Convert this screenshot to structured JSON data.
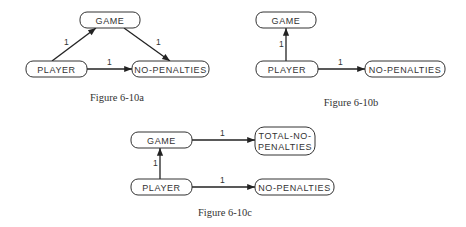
{
  "figures": [
    {
      "id": "a",
      "caption": "Figure 6-10a",
      "nodes": {
        "game": "GAME",
        "player": "PLAYER",
        "no_penalties": "NO-PENALTIES"
      },
      "edges": [
        {
          "from": "PLAYER",
          "to": "GAME",
          "label": "1"
        },
        {
          "from": "GAME",
          "to": "NO-PENALTIES",
          "label": "1"
        },
        {
          "from": "PLAYER",
          "to": "NO-PENALTIES",
          "label": "1"
        }
      ]
    },
    {
      "id": "b",
      "caption": "Figure 6-10b",
      "nodes": {
        "game": "GAME",
        "player": "PLAYER",
        "no_penalties": "NO-PENALTIES"
      },
      "edges": [
        {
          "from": "PLAYER",
          "to": "GAME",
          "label": "1"
        },
        {
          "from": "PLAYER",
          "to": "NO-PENALTIES",
          "label": "1"
        }
      ]
    },
    {
      "id": "c",
      "caption": "Figure 6-10c",
      "nodes": {
        "game": "GAME",
        "player": "PLAYER",
        "no_penalties": "NO-PENALTIES",
        "total_no_penalties_line1": "TOTAL-NO-",
        "total_no_penalties_line2": "PENALTIES"
      },
      "edges": [
        {
          "from": "GAME",
          "to": "TOTAL-NO-PENALTIES",
          "label": "1"
        },
        {
          "from": "PLAYER",
          "to": "GAME",
          "label": "1"
        },
        {
          "from": "PLAYER",
          "to": "NO-PENALTIES",
          "label": "1"
        }
      ]
    }
  ]
}
